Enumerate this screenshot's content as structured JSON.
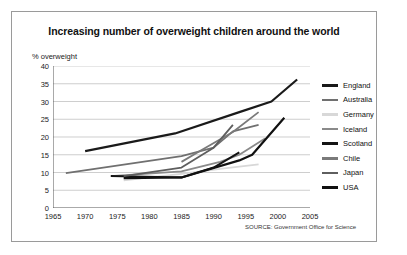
{
  "figure": {
    "title": "Increasing number of overweight children around the world",
    "source_note": "SOURCE: Government Office for Science",
    "background": "#ffffff",
    "border_color": "#9a9a9a"
  },
  "chart_data": {
    "type": "line",
    "title": "Increasing number of overweight children around the world",
    "xlabel": "",
    "ylabel": "% overweight",
    "xlim": [
      1965,
      2005
    ],
    "ylim": [
      0,
      40
    ],
    "xticks": [
      1965,
      1970,
      1975,
      1980,
      1985,
      1990,
      1995,
      2000,
      2005
    ],
    "yticks": [
      0,
      5,
      10,
      15,
      20,
      25,
      30,
      35,
      40
    ],
    "grid": true,
    "grid_axis": "y",
    "legend_position": "right",
    "series": [
      {
        "name": "England",
        "color": "#1a1a1a",
        "width": 2.2,
        "x": [
          1970,
          1984,
          1994,
          1999,
          2003
        ],
        "y": [
          16.0,
          21.0,
          27.0,
          30.0,
          36.2
        ]
      },
      {
        "name": "Australia",
        "color": "#707070",
        "width": 1.8,
        "x": [
          1967,
          1985,
          1990,
          1993,
          1997
        ],
        "y": [
          9.8,
          14.6,
          17.0,
          21.6,
          23.4
        ]
      },
      {
        "name": "Germany",
        "color": "#d8d8d8",
        "width": 1.8,
        "x": [
          1976,
          1985,
          1991,
          1997
        ],
        "y": [
          7.8,
          9.6,
          11.0,
          12.3
        ]
      },
      {
        "name": "Iceland",
        "color": "#8a8a8a",
        "width": 1.8,
        "x": [
          1974,
          1985,
          1991,
          1994,
          1998
        ],
        "y": [
          9.0,
          10.3,
          13.0,
          15.0,
          19.6
        ]
      },
      {
        "name": "Scotland",
        "color": "#141414",
        "width": 2.0,
        "x": [
          1974,
          1985,
          1990,
          1994
        ],
        "y": [
          9.0,
          8.6,
          11.4,
          15.7
        ]
      },
      {
        "name": "Chile",
        "color": "#7a7a7a",
        "width": 1.8,
        "x": [
          1985,
          1988,
          1993,
          1997
        ],
        "y": [
          13.0,
          16.2,
          21.4,
          27.0
        ]
      },
      {
        "name": "Japan",
        "color": "#5e5e5e",
        "width": 1.8,
        "x": [
          1976,
          1985,
          1990,
          1993
        ],
        "y": [
          9.0,
          11.4,
          17.0,
          23.4
        ]
      },
      {
        "name": "USA",
        "color": "#111111",
        "width": 2.2,
        "x": [
          1976,
          1985,
          1994,
          1996,
          2001
        ],
        "y": [
          8.4,
          8.6,
          13.4,
          15.0,
          25.4
        ]
      }
    ]
  },
  "legend": {
    "items": [
      {
        "label": "England",
        "color": "#1a1a1a"
      },
      {
        "label": "Australia",
        "color": "#707070"
      },
      {
        "label": "Germany",
        "color": "#d8d8d8"
      },
      {
        "label": "Iceland",
        "color": "#8a8a8a"
      },
      {
        "label": "Scotland",
        "color": "#141414"
      },
      {
        "label": "Chile",
        "color": "#7a7a7a"
      },
      {
        "label": "Japan",
        "color": "#5e5e5e"
      },
      {
        "label": "USA",
        "color": "#111111"
      }
    ]
  }
}
